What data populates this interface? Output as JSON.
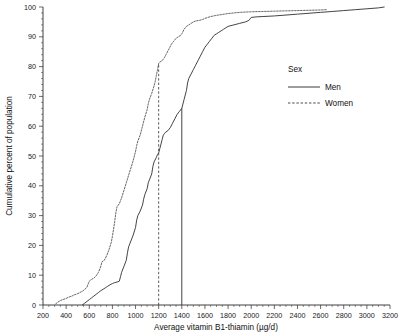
{
  "chart_data": {
    "type": "line",
    "title": "",
    "xlabel": "Average vitamin B1-thiamin (µg/d)",
    "ylabel": "Cumulative percent of population",
    "xlim": [
      200,
      3200
    ],
    "ylim": [
      0,
      100
    ],
    "xticks": [
      200,
      400,
      600,
      800,
      1000,
      1200,
      1400,
      1600,
      1800,
      2000,
      2200,
      2400,
      2600,
      2800,
      3000,
      3200
    ],
    "yticks": [
      0,
      10,
      20,
      30,
      40,
      50,
      60,
      70,
      80,
      90,
      100
    ],
    "grid": false,
    "legend": {
      "title": "Sex",
      "position": "inside-right",
      "entries": [
        {
          "name": "Men",
          "style": "solid"
        },
        {
          "name": "Women",
          "style": "dashed"
        }
      ]
    },
    "annotations": [
      {
        "name": "women-median-reference",
        "style": "dashed",
        "x": 1200,
        "y_top": 81
      },
      {
        "name": "men-median-reference",
        "style": "solid",
        "x": 1400,
        "y_top": 66
      }
    ],
    "series": [
      {
        "name": "Men",
        "style": "solid",
        "points": [
          [
            540,
            0
          ],
          [
            560,
            0.6
          ],
          [
            580,
            1.2
          ],
          [
            600,
            1.8
          ],
          [
            620,
            2.4
          ],
          [
            640,
            3.0
          ],
          [
            660,
            3.6
          ],
          [
            680,
            4.2
          ],
          [
            700,
            4.8
          ],
          [
            720,
            5.3
          ],
          [
            740,
            5.8
          ],
          [
            760,
            6.3
          ],
          [
            780,
            6.8
          ],
          [
            800,
            7.2
          ],
          [
            820,
            7.5
          ],
          [
            840,
            7.7
          ],
          [
            860,
            8.0
          ],
          [
            870,
            9.5
          ],
          [
            880,
            11.0
          ],
          [
            900,
            13.0
          ],
          [
            920,
            15.0
          ],
          [
            930,
            17.5
          ],
          [
            940,
            19.5
          ],
          [
            950,
            20.5
          ],
          [
            960,
            21.5
          ],
          [
            980,
            23.5
          ],
          [
            1000,
            26.0
          ],
          [
            1010,
            28.5
          ],
          [
            1020,
            30.0
          ],
          [
            1040,
            31.5
          ],
          [
            1060,
            33.5
          ],
          [
            1070,
            35.5
          ],
          [
            1080,
            37.0
          ],
          [
            1100,
            39.0
          ],
          [
            1110,
            41.0
          ],
          [
            1120,
            42.0
          ],
          [
            1140,
            44.0
          ],
          [
            1150,
            46.5
          ],
          [
            1160,
            48.0
          ],
          [
            1180,
            49.5
          ],
          [
            1190,
            50.5
          ],
          [
            1200,
            51.0
          ],
          [
            1210,
            52.5
          ],
          [
            1220,
            54.0
          ],
          [
            1230,
            55.5
          ],
          [
            1240,
            57.0
          ],
          [
            1250,
            57.5
          ],
          [
            1260,
            58.0
          ],
          [
            1280,
            58.5
          ],
          [
            1300,
            59.5
          ],
          [
            1320,
            61.0
          ],
          [
            1340,
            62.5
          ],
          [
            1360,
            64.0
          ],
          [
            1380,
            65.0
          ],
          [
            1400,
            66.0
          ],
          [
            1420,
            69.0
          ],
          [
            1440,
            72.0
          ],
          [
            1450,
            74.5
          ],
          [
            1460,
            76.0
          ],
          [
            1480,
            77.5
          ],
          [
            1500,
            79.0
          ],
          [
            1520,
            80.5
          ],
          [
            1540,
            82.0
          ],
          [
            1560,
            83.5
          ],
          [
            1580,
            85.0
          ],
          [
            1600,
            86.5
          ],
          [
            1620,
            87.5
          ],
          [
            1640,
            88.5
          ],
          [
            1660,
            89.5
          ],
          [
            1680,
            90.5
          ],
          [
            1700,
            91.0
          ],
          [
            1720,
            91.5
          ],
          [
            1740,
            92.0
          ],
          [
            1760,
            92.5
          ],
          [
            1780,
            93.0
          ],
          [
            1800,
            93.5
          ],
          [
            1850,
            94.0
          ],
          [
            1900,
            94.5
          ],
          [
            1950,
            95.0
          ],
          [
            1980,
            95.5
          ],
          [
            2000,
            96.5
          ],
          [
            2050,
            96.7
          ],
          [
            2100,
            96.8
          ],
          [
            2200,
            97.0
          ],
          [
            2300,
            97.3
          ],
          [
            2400,
            97.6
          ],
          [
            2500,
            97.9
          ],
          [
            2600,
            98.2
          ],
          [
            2700,
            98.5
          ],
          [
            2800,
            98.8
          ],
          [
            2900,
            99.1
          ],
          [
            3000,
            99.4
          ],
          [
            3100,
            99.7
          ],
          [
            3150,
            100
          ]
        ]
      },
      {
        "name": "Women",
        "style": "dashed",
        "points": [
          [
            310,
            0.4
          ],
          [
            330,
            1.0
          ],
          [
            350,
            1.5
          ],
          [
            370,
            1.8
          ],
          [
            400,
            2.2
          ],
          [
            420,
            2.6
          ],
          [
            450,
            3.0
          ],
          [
            470,
            3.4
          ],
          [
            500,
            3.8
          ],
          [
            520,
            4.2
          ],
          [
            540,
            4.6
          ],
          [
            560,
            5.2
          ],
          [
            580,
            6.0
          ],
          [
            590,
            7.0
          ],
          [
            600,
            8.0
          ],
          [
            620,
            8.6
          ],
          [
            640,
            9.0
          ],
          [
            660,
            9.8
          ],
          [
            680,
            11.0
          ],
          [
            700,
            13.0
          ],
          [
            710,
            14.5
          ],
          [
            730,
            15.0
          ],
          [
            750,
            16.5
          ],
          [
            770,
            18.5
          ],
          [
            790,
            21.0
          ],
          [
            800,
            23.0
          ],
          [
            810,
            25.5
          ],
          [
            820,
            28.0
          ],
          [
            830,
            31.0
          ],
          [
            840,
            33.0
          ],
          [
            860,
            34.0
          ],
          [
            880,
            36.0
          ],
          [
            900,
            38.5
          ],
          [
            920,
            41.0
          ],
          [
            940,
            43.5
          ],
          [
            960,
            46.0
          ],
          [
            980,
            48.5
          ],
          [
            1000,
            51.5
          ],
          [
            1010,
            53.5
          ],
          [
            1020,
            55.0
          ],
          [
            1040,
            57.0
          ],
          [
            1060,
            60.0
          ],
          [
            1080,
            63.0
          ],
          [
            1100,
            65.5
          ],
          [
            1110,
            67.5
          ],
          [
            1120,
            69.0
          ],
          [
            1140,
            71.0
          ],
          [
            1160,
            73.5
          ],
          [
            1170,
            75.0
          ],
          [
            1180,
            77.0
          ],
          [
            1190,
            79.0
          ],
          [
            1200,
            81.0
          ],
          [
            1210,
            81.5
          ],
          [
            1230,
            82.0
          ],
          [
            1250,
            83.0
          ],
          [
            1270,
            84.5
          ],
          [
            1290,
            86.0
          ],
          [
            1310,
            87.5
          ],
          [
            1330,
            88.5
          ],
          [
            1350,
            89.5
          ],
          [
            1370,
            90.0
          ],
          [
            1390,
            90.5
          ],
          [
            1400,
            91.0
          ],
          [
            1420,
            92.5
          ],
          [
            1440,
            93.5
          ],
          [
            1460,
            94.0
          ],
          [
            1480,
            94.5
          ],
          [
            1500,
            95.0
          ],
          [
            1520,
            95.3
          ],
          [
            1550,
            95.5
          ],
          [
            1580,
            95.8
          ],
          [
            1600,
            96.2
          ],
          [
            1650,
            96.8
          ],
          [
            1700,
            97.2
          ],
          [
            1750,
            97.5
          ],
          [
            1800,
            97.8
          ],
          [
            1850,
            98.0
          ],
          [
            1900,
            98.2
          ],
          [
            1950,
            98.3
          ],
          [
            2000,
            98.4
          ],
          [
            2100,
            98.5
          ],
          [
            2200,
            98.6
          ],
          [
            2300,
            98.7
          ],
          [
            2400,
            98.8
          ],
          [
            2500,
            98.9
          ],
          [
            2600,
            99.0
          ],
          [
            2650,
            99.1
          ]
        ]
      }
    ]
  }
}
